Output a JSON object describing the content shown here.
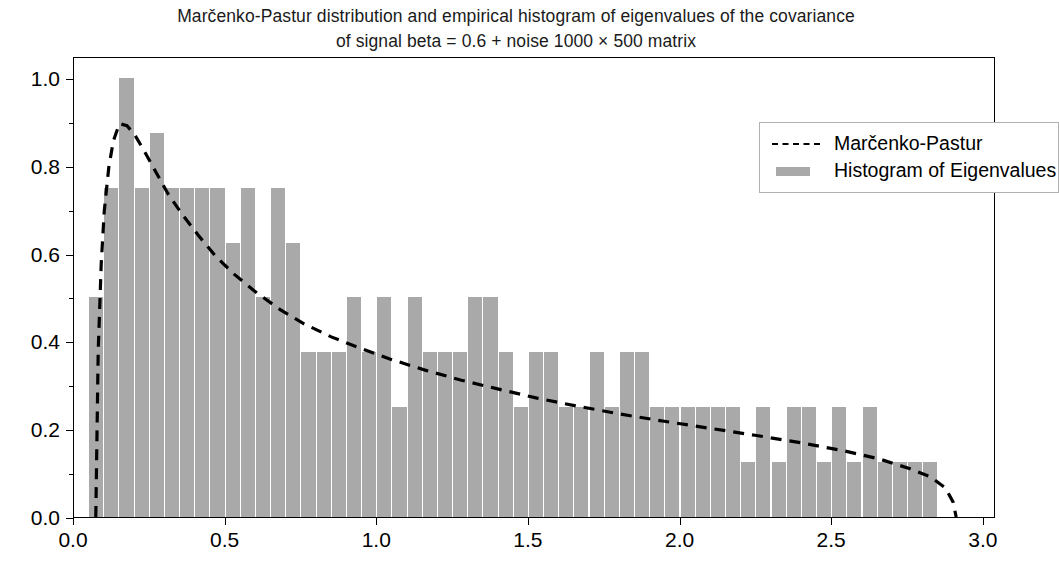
{
  "figure": {
    "title_line1": "Marčenko-Pastur distribution and empirical histogram of eigenvalues of the covariance",
    "title_line2": "of signal beta = 0.6 + noise 1000 × 500 matrix",
    "background": "#ffffff",
    "bar_color": "#a9a9a9",
    "curve_color": "#000000"
  },
  "legend": {
    "position": "upper right",
    "items": [
      {
        "label": "Marčenko-Pastur",
        "key": "dashed-line",
        "color": "#000000"
      },
      {
        "label": "Histogram of Eigenvalues",
        "key": "filled-patch",
        "color": "#a9a9a9"
      }
    ]
  },
  "axes": {
    "xticklabels": [
      "0.0",
      "0.5",
      "1.0",
      "1.5",
      "2.0",
      "2.5",
      "3.0"
    ],
    "xtickvalues": [
      0.0,
      0.5,
      1.0,
      1.5,
      2.0,
      2.5,
      3.0
    ],
    "yticklabels": [
      "0.0",
      "0.2",
      "0.4",
      "0.6",
      "0.8",
      "1.0"
    ],
    "ytickvalues": [
      0.0,
      0.2,
      0.4,
      0.6,
      0.8,
      1.0
    ],
    "xlabel": "",
    "ylabel": "",
    "xlim": [
      0.0,
      3.04
    ],
    "ylim": [
      0.0,
      1.05
    ]
  },
  "chart_data": {
    "type": "bar",
    "title": "Marčenko-Pastur distribution and empirical histogram of eigenvalues of the covariance of signal beta = 0.6 + noise 1000 × 500 matrix",
    "xlabel": "",
    "ylabel": "",
    "xlim": [
      0.0,
      3.04
    ],
    "ylim": [
      0.0,
      1.05
    ],
    "grid": false,
    "legend_position": "upper right",
    "series": [
      {
        "name": "Histogram of Eigenvalues",
        "type": "bar",
        "color": "#a9a9a9",
        "bin_width": 0.05,
        "bin_left_edges": [
          0.05,
          0.1,
          0.15,
          0.2,
          0.25,
          0.3,
          0.35,
          0.4,
          0.45,
          0.5,
          0.55,
          0.6,
          0.65,
          0.7,
          0.75,
          0.8,
          0.85,
          0.9,
          0.95,
          1.0,
          1.05,
          1.1,
          1.15,
          1.2,
          1.25,
          1.3,
          1.35,
          1.4,
          1.45,
          1.5,
          1.55,
          1.6,
          1.65,
          1.7,
          1.75,
          1.8,
          1.85,
          1.9,
          1.95,
          2.0,
          2.05,
          2.1,
          2.15,
          2.2,
          2.25,
          2.3,
          2.35,
          2.4,
          2.45,
          2.5,
          2.55,
          2.6,
          2.65,
          2.7,
          2.75,
          2.8
        ],
        "values": [
          0.5,
          0.75,
          1.0,
          0.75,
          0.875,
          0.75,
          0.75,
          0.75,
          0.75,
          0.625,
          0.75,
          0.5,
          0.75,
          0.625,
          0.375,
          0.375,
          0.375,
          0.5,
          0.375,
          0.5,
          0.25,
          0.5,
          0.375,
          0.375,
          0.375,
          0.5,
          0.5,
          0.375,
          0.25,
          0.375,
          0.375,
          0.25,
          0.25,
          0.375,
          0.25,
          0.375,
          0.375,
          0.25,
          0.25,
          0.25,
          0.25,
          0.25,
          0.25,
          0.125,
          0.25,
          0.125,
          0.25,
          0.25,
          0.125,
          0.25,
          0.125,
          0.25,
          0.125,
          0.125,
          0.125,
          0.125
        ]
      },
      {
        "name": "Marčenko-Pastur",
        "type": "line",
        "linestyle": "dashed",
        "color": "#000000",
        "x": [
          0.072,
          0.08,
          0.09,
          0.1,
          0.115,
          0.13,
          0.15,
          0.175,
          0.2,
          0.23,
          0.27,
          0.31,
          0.36,
          0.41,
          0.47,
          0.53,
          0.6,
          0.68,
          0.76,
          0.85,
          0.95,
          1.05,
          1.16,
          1.28,
          1.4,
          1.53,
          1.66,
          1.8,
          1.95,
          2.1,
          2.25,
          2.4,
          2.54,
          2.66,
          2.76,
          2.83,
          2.88,
          2.905,
          2.915
        ],
        "y": [
          0.0,
          0.38,
          0.58,
          0.7,
          0.8,
          0.86,
          0.9,
          0.895,
          0.875,
          0.84,
          0.79,
          0.74,
          0.69,
          0.645,
          0.595,
          0.555,
          0.515,
          0.475,
          0.442,
          0.412,
          0.385,
          0.36,
          0.336,
          0.313,
          0.293,
          0.272,
          0.254,
          0.236,
          0.219,
          0.203,
          0.187,
          0.17,
          0.152,
          0.133,
          0.111,
          0.092,
          0.066,
          0.034,
          0.0
        ]
      }
    ]
  }
}
